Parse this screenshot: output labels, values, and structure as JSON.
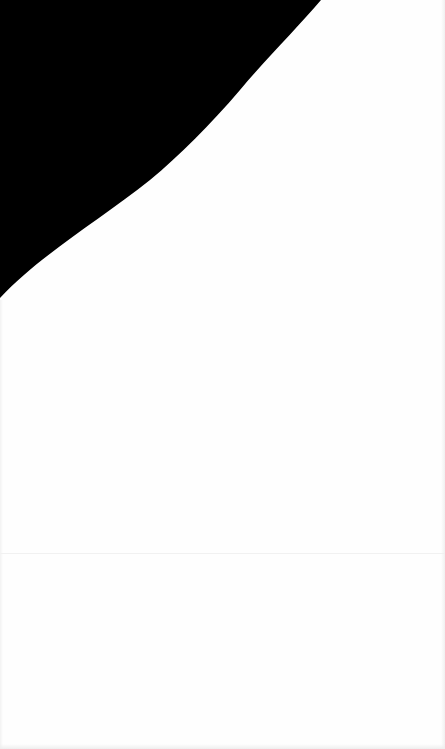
{
  "page": {
    "background_color": "#fefefe",
    "shape_color": "#000000",
    "divider_color": "#f1f1f1",
    "visible_text": []
  }
}
